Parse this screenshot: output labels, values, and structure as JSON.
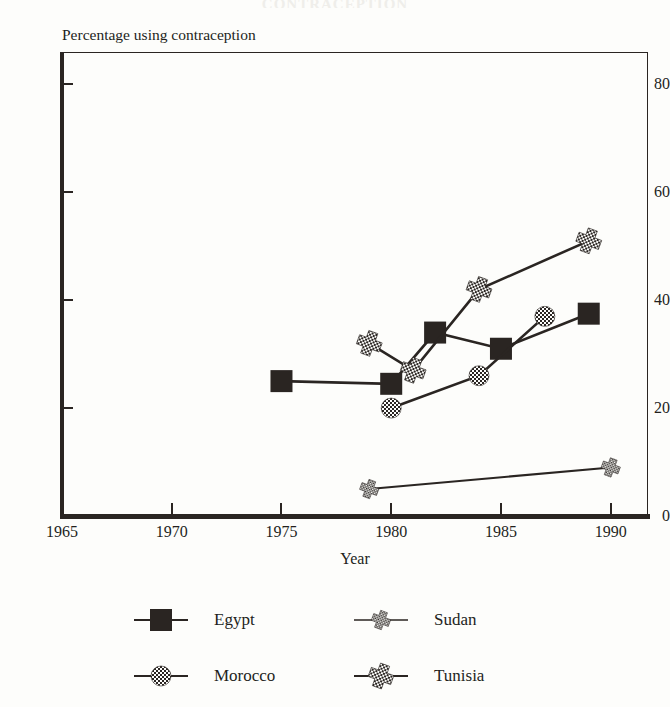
{
  "figure": {
    "cut_title": "CONTRACEPTION",
    "axis_note": "Percentage using contraception"
  },
  "chart_data": {
    "type": "line",
    "title": "",
    "subtitle": "Percentage using contraception",
    "xlabel": "Year",
    "ylabel": "",
    "xlim": [
      1965,
      1991.7
    ],
    "ylim": [
      0,
      86
    ],
    "xticks": [
      1965,
      1970,
      1975,
      1980,
      1985,
      1990
    ],
    "xticklabels": [
      "1965",
      "1970",
      "1975",
      "1980",
      "1985",
      "1990"
    ],
    "yticks": [
      0,
      20,
      40,
      60,
      80
    ],
    "yticklabels": [
      "0",
      "20",
      "40",
      "60",
      "80"
    ],
    "grid": false,
    "legend_position": "bottom",
    "series": [
      {
        "name": "Egypt",
        "marker": "filled-square",
        "x": [
          1975,
          1980,
          1982,
          1985,
          1989
        ],
        "y": [
          25,
          24.5,
          34,
          31,
          37.5
        ]
      },
      {
        "name": "Sudan",
        "marker": "small-star",
        "x": [
          1979,
          1990
        ],
        "y": [
          5,
          9
        ]
      },
      {
        "name": "Morocco",
        "marker": "checkered-circle",
        "x": [
          1980,
          1984,
          1987
        ],
        "y": [
          20,
          26,
          37
        ]
      },
      {
        "name": "Tunisia",
        "marker": "checkered-star",
        "x": [
          1979,
          1981,
          1984,
          1989
        ],
        "y": [
          32,
          27,
          42,
          51
        ]
      }
    ]
  },
  "legend": {
    "entries": [
      {
        "label": "Egypt",
        "marker": "filled-square"
      },
      {
        "label": "Sudan",
        "marker": "small-star"
      },
      {
        "label": "Morocco",
        "marker": "checkered-circle"
      },
      {
        "label": "Tunisia",
        "marker": "checkered-star"
      }
    ]
  },
  "colors": {
    "ink": "#2a2522",
    "paper": "#fdfdfb"
  }
}
